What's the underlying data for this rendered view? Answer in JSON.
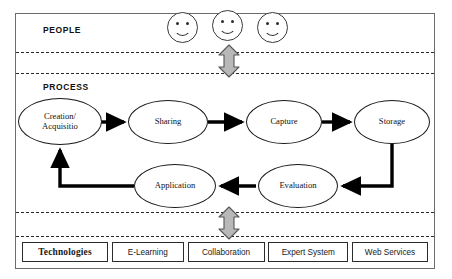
{
  "diagram": {
    "bands": {
      "people": {
        "label": "PEOPLE"
      },
      "process": {
        "label": "PROCESS"
      }
    },
    "people_icons": [
      {
        "name": "smiley-face-1"
      },
      {
        "name": "smiley-face-2"
      },
      {
        "name": "smiley-face-3"
      }
    ],
    "connectors": {
      "people_to_process": "double-headed-vertical-arrow",
      "process_to_technologies": "double-headed-vertical-arrow"
    },
    "process_steps": [
      {
        "id": "creation",
        "line1": "Creation/",
        "line2": "Acquisitio"
      },
      {
        "id": "sharing",
        "label": "Sharing"
      },
      {
        "id": "capture",
        "label": "Capture"
      },
      {
        "id": "storage",
        "label": "Storage"
      },
      {
        "id": "evaluation",
        "label": "Evaluation"
      },
      {
        "id": "application",
        "label": "Application"
      }
    ],
    "technologies": [
      {
        "label": "Technologies",
        "emphasis": true
      },
      {
        "label": "E-Learning",
        "emphasis": false
      },
      {
        "label": "Collaboration",
        "emphasis": false
      },
      {
        "label": "Expert System",
        "emphasis": false
      },
      {
        "label": "Web Services",
        "emphasis": false
      }
    ],
    "colors": {
      "frame": "#6b6b6b",
      "divider": "#2b2b2b",
      "oval_stroke": "#1a1a1a",
      "arrow_fill": "#000000",
      "gray_arrow_fill": "#b8b8b8",
      "gray_arrow_stroke": "#555555",
      "text": "#111111",
      "background": "#ffffff"
    }
  }
}
